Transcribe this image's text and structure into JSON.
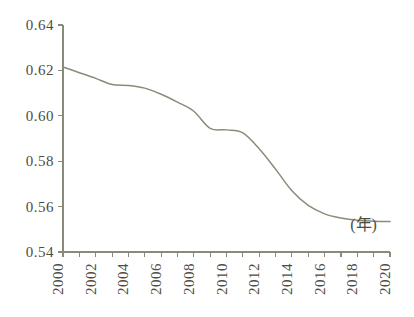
{
  "chart_data": {
    "type": "line",
    "title": "",
    "subtitle": "",
    "xlabel": "(年)",
    "ylabel": "",
    "xlim": [
      2000,
      2020
    ],
    "ylim": [
      0.54,
      0.64
    ],
    "grid": false,
    "legend": null,
    "x_tick_labels": [
      "2000",
      "2002",
      "2004",
      "2006",
      "2008",
      "2010",
      "2012",
      "2014",
      "2016",
      "2018",
      "2020"
    ],
    "y_tick_labels": [
      "0.64",
      "0.62",
      "0.60",
      "0.58",
      "0.56",
      "0.54"
    ],
    "y_ticks": [
      0.64,
      0.62,
      0.6,
      0.58,
      0.56,
      0.54
    ],
    "x_minor_tick_years": [
      2000,
      2001,
      2002,
      2003,
      2004,
      2005,
      2006,
      2007,
      2008,
      2009,
      2010,
      2011,
      2012,
      2013,
      2014,
      2015,
      2016,
      2017,
      2018,
      2019,
      2020
    ],
    "x": [
      2000,
      2001,
      2002,
      2003,
      2004,
      2005,
      2006,
      2007,
      2008,
      2009,
      2010,
      2011,
      2012,
      2013,
      2014,
      2015,
      2016,
      2017,
      2018,
      2019,
      2020
    ],
    "values": [
      0.6215,
      0.619,
      0.6165,
      0.6138,
      0.6134,
      0.6122,
      0.6095,
      0.606,
      0.602,
      0.5945,
      0.5938,
      0.5925,
      0.5855,
      0.5765,
      0.567,
      0.5605,
      0.5568,
      0.555,
      0.554,
      0.5536,
      0.5534
    ],
    "series": [
      {
        "name": "series-1",
        "color": "#8c8a78",
        "values": [
          0.6215,
          0.619,
          0.6165,
          0.6138,
          0.6134,
          0.6122,
          0.6095,
          0.606,
          0.602,
          0.5945,
          0.5938,
          0.5925,
          0.5855,
          0.5765,
          0.567,
          0.5605,
          0.5568,
          0.555,
          0.554,
          0.5536,
          0.5534
        ]
      }
    ],
    "annotations": [
      {
        "text": "(年)",
        "x": 2019.2,
        "y": 0.5495
      }
    ],
    "colors": {
      "line": "#8c8a78",
      "axis": "#8a8a7a",
      "text": "#4d4d44",
      "background": "#ffffff"
    }
  }
}
